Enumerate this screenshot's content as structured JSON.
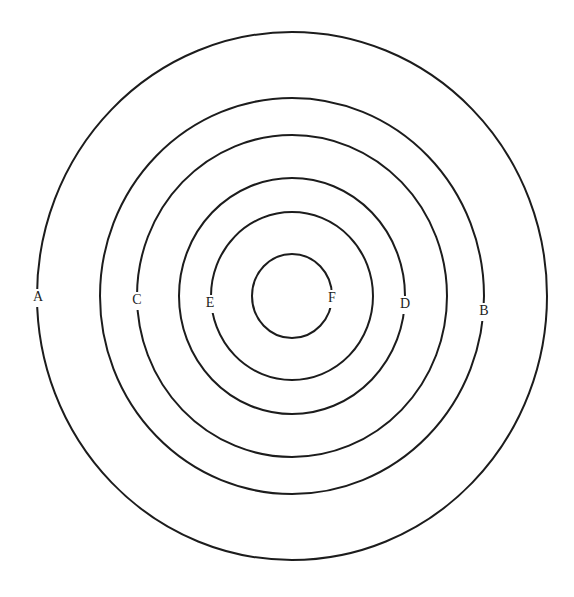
{
  "diagram": {
    "type": "concentric-circles",
    "center": [
      292,
      296
    ],
    "line_color": "#1c1c1c",
    "background": "#ffffff",
    "rings": [
      {
        "id": "ring-1",
        "rx": 255,
        "ry": 264,
        "label": "A",
        "label_pos": [
          38,
          298
        ]
      },
      {
        "id": "ring-2",
        "rx": 192,
        "ry": 198,
        "label": "B",
        "label_pos": [
          484,
          312
        ]
      },
      {
        "id": "ring-3",
        "rx": 155,
        "ry": 161,
        "label": "C",
        "label_pos": [
          137,
          301
        ]
      },
      {
        "id": "ring-4",
        "rx": 113,
        "ry": 118,
        "label": "D",
        "label_pos": [
          405,
          305
        ]
      },
      {
        "id": "ring-5",
        "rx": 81,
        "ry": 84,
        "label": "E",
        "label_pos": [
          210,
          304
        ]
      },
      {
        "id": "ring-6",
        "rx": 40,
        "ry": 42,
        "label": "F",
        "label_pos": [
          332,
          299
        ]
      }
    ]
  }
}
